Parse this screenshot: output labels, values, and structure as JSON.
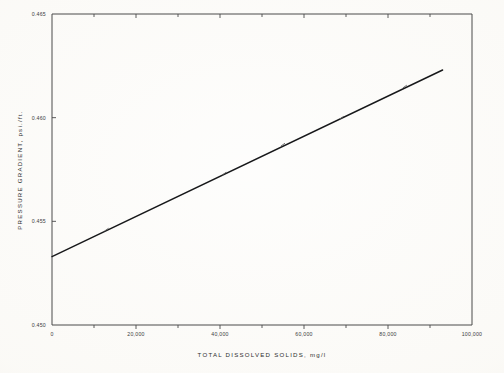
{
  "chart_data": {
    "type": "line",
    "title": "",
    "xlabel": "TOTAL DISSOLVED SOLIDS, mg/l",
    "ylabel": "PRESSURE GRADIENT, psi./ft.",
    "xlim": [
      0,
      100000
    ],
    "ylim": [
      0.45,
      0.465
    ],
    "grid": false,
    "legend": "none",
    "x_major_ticks": [
      0,
      20000,
      40000,
      60000,
      80000,
      100000
    ],
    "x_major_tick_labels": [
      "0",
      "20,000",
      "40,000",
      "60,000",
      "80,000",
      "100,000"
    ],
    "x_minor_ticks": [
      10000,
      30000,
      50000,
      70000,
      90000
    ],
    "y_major_ticks": [
      0.45,
      0.455,
      0.46,
      0.465
    ],
    "y_major_tick_labels": [
      "0.450",
      "0.455",
      "0.460",
      "0.465"
    ],
    "series": [
      {
        "name": "pressure gradient vs total dissolved solids",
        "line_endpoints": [
          {
            "x": 0,
            "y": 0.4533
          },
          {
            "x": 93000,
            "y": 0.4623
          }
        ],
        "x": [
          0,
          13000,
          41000,
          55000,
          69000,
          84000,
          93000
        ],
        "values": [
          0.4533,
          0.4546,
          0.4573,
          0.4587,
          0.46,
          0.4615,
          0.4623
        ],
        "marker_points": [
          {
            "x": 13000,
            "y": 0.4546
          },
          {
            "x": 41000,
            "y": 0.4573
          },
          {
            "x": 55000,
            "y": 0.4587
          },
          {
            "x": 69000,
            "y": 0.46
          },
          {
            "x": 84000,
            "y": 0.4615
          }
        ]
      }
    ]
  },
  "colors": {
    "paper": "#fbfaf7",
    "axis": "#4a4a4a",
    "data_line": "#17181a",
    "text": "#2e2e2e"
  }
}
